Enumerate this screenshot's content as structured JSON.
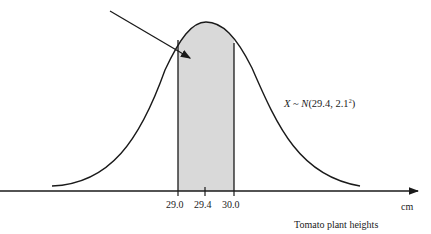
{
  "diagram": {
    "type": "normal-distribution",
    "distribution_label": {
      "var": "X",
      "tilde": "~",
      "N": "N",
      "params": "(29.4, 2.1",
      "exp": "2",
      "close": ")"
    },
    "axis": {
      "unit": "cm",
      "title": "Tomato plant heights",
      "ticks": [
        "29.0",
        "29.4",
        "30.0"
      ]
    },
    "shaded_region": {
      "from": "29.0",
      "to": "30.0",
      "fill": "#d9d9d9"
    },
    "colors": {
      "stroke": "#1a1a1a",
      "shade": "#d9d9d9",
      "background": "#ffffff"
    }
  }
}
